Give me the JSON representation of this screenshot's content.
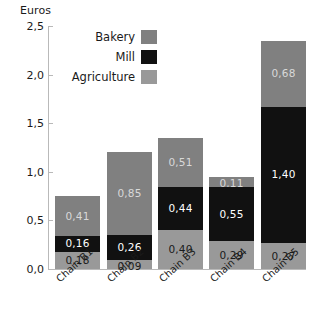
{
  "chart_data": {
    "type": "bar",
    "stacked": true,
    "title": "",
    "xlabel": "",
    "ylabel": "Euros",
    "ylim": [
      0,
      2.5
    ],
    "ytick_labels": [
      "0,0",
      "0,5",
      "1,0",
      "1,5",
      "2,0",
      "2,5"
    ],
    "ytick_values": [
      0,
      0.5,
      1.0,
      1.5,
      2.0,
      2.5
    ],
    "grid": false,
    "legend_position": "top-left-inside",
    "categories": [
      "Chain B1",
      "Chain B2",
      "Chain B3",
      "Chain B4",
      "Chain B5"
    ],
    "series": [
      {
        "name": "Bakery",
        "color": "#808080",
        "values": [
          0.41,
          0.85,
          0.51,
          0.11,
          0.68
        ],
        "labels": [
          "0,41",
          "0,85",
          "0,51",
          "0,11",
          "0,68"
        ]
      },
      {
        "name": "Mill",
        "color": "#111111",
        "values": [
          0.16,
          0.26,
          0.44,
          0.55,
          1.4
        ],
        "labels": [
          "0,16",
          "0,26",
          "0,44",
          "0,55",
          "1,40"
        ]
      },
      {
        "name": "Agriculture",
        "color": "#999999",
        "values": [
          0.18,
          0.09,
          0.4,
          0.29,
          0.27
        ],
        "labels": [
          "0,18",
          "0,09",
          "0,40",
          "0,29",
          "0,27"
        ]
      }
    ],
    "totals": [
      0.75,
      1.2,
      1.35,
      0.95,
      2.35
    ]
  },
  "legend": {
    "items": [
      {
        "label": "Bakery",
        "color": "#808080"
      },
      {
        "label": "Mill",
        "color": "#111111"
      },
      {
        "label": "Agriculture",
        "color": "#999999"
      }
    ]
  },
  "axis": {
    "y_title": "Euros"
  }
}
